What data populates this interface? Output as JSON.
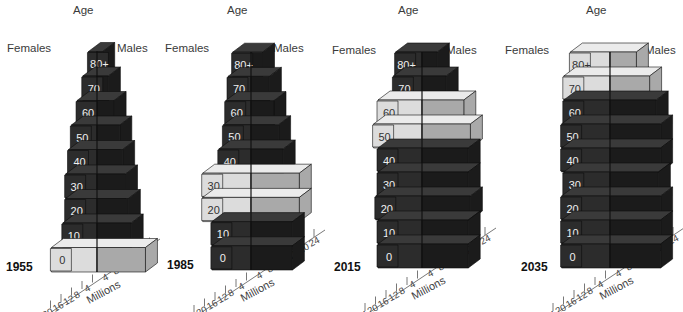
{
  "chart_data": {
    "type": "population-pyramid-3d",
    "title": "",
    "xlabel": "Millions",
    "ylabel": "Age",
    "left_label": "Females",
    "right_label": "Males",
    "age_groups": [
      "0",
      "10",
      "20",
      "30",
      "40",
      "50",
      "60",
      "70",
      "80+"
    ],
    "highlight_description": "Light-gray blocks mark the baby-boom cohort as it ages",
    "colors": {
      "dark_front": "#2c2c2c",
      "dark_top": "#3a3a3a",
      "dark_side": "#1b1b1b",
      "light_front": "#dcdcdc",
      "light_top": "#ebebeb",
      "light_side": "#c4c4c4",
      "light_male": "#a9a9a9",
      "divider": "#111111"
    },
    "panels": [
      {
        "year": "1955",
        "axis_ticks_females": [
          "20",
          "16",
          "12",
          "8",
          "4"
        ],
        "axis_ticks_males": [
          "4",
          "8",
          "12",
          "16",
          "20"
        ],
        "females": [
          16,
          12,
          11,
          11,
          10,
          9,
          7,
          5,
          3
        ],
        "males": [
          17,
          12,
          11,
          10,
          9,
          8,
          6,
          4,
          2
        ],
        "highlight": [
          0
        ]
      },
      {
        "year": "1985",
        "axis_ticks_females": [
          "24",
          "20",
          "16",
          "12",
          "8",
          "4"
        ],
        "axis_ticks_males": [
          "4",
          "8",
          "12",
          "16",
          "20",
          "24"
        ],
        "females": [
          17,
          17,
          21,
          21,
          14,
          12,
          11,
          10,
          8
        ],
        "males": [
          18,
          18,
          21,
          21,
          14,
          12,
          10,
          8,
          5
        ],
        "highlight": [
          2,
          3
        ]
      },
      {
        "year": "2015",
        "axis_ticks_females": [
          "24",
          "20",
          "16",
          "12",
          "8",
          "4"
        ],
        "axis_ticks_males": [
          "4",
          "8",
          "12",
          "16",
          "20",
          "24"
        ],
        "females": [
          20,
          20,
          21,
          20,
          20,
          22,
          20,
          13,
          12
        ],
        "males": [
          21,
          21,
          22,
          21,
          21,
          22,
          19,
          11,
          7
        ],
        "highlight": [
          5,
          6
        ]
      },
      {
        "year": "2035",
        "axis_ticks_females": [
          "24",
          "20",
          "16",
          "12",
          "8",
          "4"
        ],
        "axis_ticks_males": [
          "4",
          "8",
          "12",
          "16",
          "20",
          "24"
        ],
        "females": [
          22,
          22,
          22,
          21,
          22,
          22,
          21,
          21,
          18
        ],
        "males": [
          23,
          23,
          23,
          22,
          23,
          23,
          21,
          18,
          12
        ],
        "highlight": [
          7,
          8
        ]
      }
    ]
  },
  "labels": {
    "age": "Age",
    "females": "Females",
    "males": "Males",
    "millions": "Millions"
  }
}
